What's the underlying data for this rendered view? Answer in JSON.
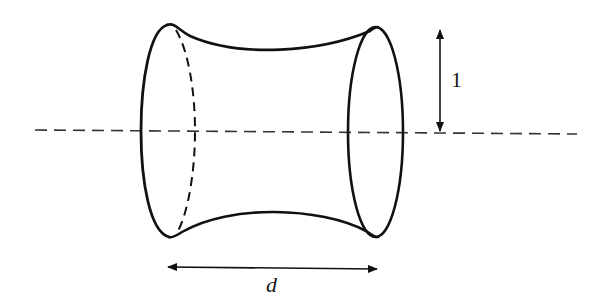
{
  "diagram": {
    "labels": {
      "radius": "1",
      "separation": "d"
    },
    "colors": {
      "stroke": "#111111",
      "axis": "#333333",
      "background": "#ffffff"
    },
    "elements": [
      {
        "name": "axis-of-rotation",
        "style": "dashed"
      },
      {
        "name": "left-ring",
        "style": "solid front, dashed back"
      },
      {
        "name": "right-ring",
        "style": "solid ellipse"
      },
      {
        "name": "surface-profile-top",
        "style": "solid concave curve"
      },
      {
        "name": "surface-profile-bottom",
        "style": "solid concave curve"
      },
      {
        "name": "radius-arrow",
        "label_ref": "radius"
      },
      {
        "name": "separation-arrow",
        "label_ref": "separation"
      }
    ]
  }
}
